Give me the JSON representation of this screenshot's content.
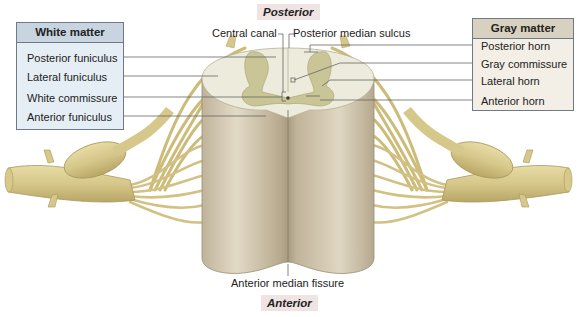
{
  "orientation": {
    "top": "Posterior",
    "bottom": "Anterior"
  },
  "white_matter_box": {
    "title": "White matter",
    "items": [
      "Posterior funiculus",
      "Lateral funiculus",
      "White commissure",
      "Anterior funiculus"
    ]
  },
  "gray_matter_box": {
    "title": "Gray matter",
    "items": [
      "Posterior horn",
      "Gray commissure",
      "Lateral horn",
      "Anterior horn"
    ]
  },
  "top_labels": {
    "central_canal": "Central canal",
    "posterior_median_sulcus": "Posterior median sulcus"
  },
  "bottom_labels": {
    "anterior_median_fissure": "Anterior median fissure"
  },
  "colors": {
    "white_matter_box_bg": "#e6eef5",
    "gray_matter_box_bg": "#f3efe6",
    "orientation_label_bg": "#efe3e3",
    "cord_surface": "#cfc4ad",
    "cross_section_white": "#ecebdc",
    "cross_section_gray": "#c9c597",
    "nerve_roots": "#d9c98a",
    "leader_lines": "#666666"
  }
}
